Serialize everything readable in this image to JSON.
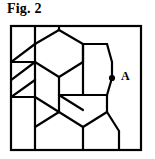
{
  "figure": {
    "caption": "Fig. 2",
    "type": "honeycomb-lattice-diagram",
    "stroke_color": "#000000",
    "frame_color": "#000000",
    "background_color": "#ffffff",
    "line_width": 2.2,
    "frame_line_width": 2.2
  },
  "frame": {
    "x": 11,
    "y": 26,
    "width": 130,
    "height": 124
  },
  "labels": {
    "point_a": "A"
  },
  "markers": {
    "point_a": {
      "label": "A",
      "dot_x": 112,
      "dot_y": 78,
      "dot_radius": 3.1,
      "label_x": 121,
      "label_y": 80
    }
  },
  "lattice": {
    "geometry_note": "Pointy-top hexagons in a honeycomb tiling, clipped by the frame rectangle.",
    "edges": [
      {
        "name": "hex-edge-top-left-stub",
        "x1": 35,
        "y1": 26,
        "x2": 35,
        "y2": 44
      },
      {
        "name": "hex-edge-upper-left-diag-a",
        "x1": 35,
        "y1": 44,
        "x2": 11,
        "y2": 62
      },
      {
        "name": "hex-edge-upper-mid-diag-a",
        "x1": 35,
        "y1": 44,
        "x2": 59,
        "y2": 30
      },
      {
        "name": "hex-edge-top-mid-stub",
        "x1": 59,
        "y1": 30,
        "x2": 59,
        "y2": 26
      },
      {
        "name": "hex-edge-upper-right-diag-a",
        "x1": 59,
        "y1": 30,
        "x2": 83,
        "y2": 44
      },
      {
        "name": "hex-edge-upper-right-vert-a",
        "x1": 83,
        "y1": 44,
        "x2": 83,
        "y2": 62
      },
      {
        "name": "hex-edge-mid-upper-diag-b",
        "x1": 83,
        "y1": 62,
        "x2": 59,
        "y2": 77
      },
      {
        "name": "hex-edge-mid-left-diag-b",
        "x1": 59,
        "y1": 77,
        "x2": 35,
        "y2": 62
      },
      {
        "name": "hex-edge-mid-left-vert-b",
        "x1": 35,
        "y1": 62,
        "x2": 35,
        "y2": 44
      },
      {
        "name": "hex-edge-left-stub-upper",
        "x1": 11,
        "y1": 62,
        "x2": 35,
        "y2": 62
      },
      {
        "name": "hex-edge-left-diag-mid",
        "x1": 35,
        "y1": 62,
        "x2": 11,
        "y2": 80
      },
      {
        "name": "hex-edge-left-lower-vert",
        "x1": 35,
        "y1": 62,
        "x2": 35,
        "y2": 80
      },
      {
        "name": "hex-edge-left-lower-diag",
        "x1": 35,
        "y1": 80,
        "x2": 11,
        "y2": 97
      },
      {
        "name": "hex-edge-left-stub-lower",
        "x1": 11,
        "y1": 97,
        "x2": 35,
        "y2": 97
      },
      {
        "name": "hex-edge-left-mid-vert-c",
        "x1": 35,
        "y1": 80,
        "x2": 35,
        "y2": 97
      },
      {
        "name": "hex-edge-mid-lower-diag-c",
        "x1": 35,
        "y1": 97,
        "x2": 59,
        "y2": 112
      },
      {
        "name": "hex-edge-mid-center-vert-c",
        "x1": 59,
        "y1": 77,
        "x2": 59,
        "y2": 95
      },
      {
        "name": "hex-edge-mid-right-diag-c",
        "x1": 59,
        "y1": 95,
        "x2": 83,
        "y2": 110
      },
      {
        "name": "hex-edge-right-upper-diag-a",
        "x1": 83,
        "y1": 44,
        "x2": 107,
        "y2": 44
      },
      {
        "name": "hex-edge-right-top-a",
        "x1": 107,
        "y1": 44,
        "x2": 112,
        "y2": 62
      },
      {
        "name": "hex-edge-right-vert-a",
        "x1": 112,
        "y1": 62,
        "x2": 112,
        "y2": 78
      },
      {
        "name": "hex-edge-right-lower-diag-a",
        "x1": 112,
        "y1": 78,
        "x2": 107,
        "y2": 95
      },
      {
        "name": "hex-edge-right-bottom-a",
        "x1": 107,
        "y1": 95,
        "x2": 83,
        "y2": 95
      },
      {
        "name": "hex-edge-right-mid-link",
        "x1": 83,
        "y1": 62,
        "x2": 83,
        "y2": 44
      },
      {
        "name": "hex-edge-center-right-vert",
        "x1": 83,
        "y1": 95,
        "x2": 83,
        "y2": 62
      },
      {
        "name": "hex-edge-center-low-left",
        "x1": 83,
        "y1": 95,
        "x2": 59,
        "y2": 95
      },
      {
        "name": "hex-edge-lower-center-vert",
        "x1": 59,
        "y1": 95,
        "x2": 59,
        "y2": 112
      },
      {
        "name": "hex-edge-lower-left-diag",
        "x1": 59,
        "y1": 112,
        "x2": 35,
        "y2": 127
      },
      {
        "name": "hex-edge-lower-left-stub",
        "x1": 35,
        "y1": 127,
        "x2": 35,
        "y2": 150
      },
      {
        "name": "hex-edge-lower-center-diag",
        "x1": 59,
        "y1": 112,
        "x2": 83,
        "y2": 127
      },
      {
        "name": "hex-edge-lower-center-stub",
        "x1": 83,
        "y1": 127,
        "x2": 83,
        "y2": 150
      },
      {
        "name": "hex-edge-lower-right-diag",
        "x1": 83,
        "y1": 127,
        "x2": 107,
        "y2": 112
      },
      {
        "name": "hex-edge-lower-right-vert",
        "x1": 107,
        "y1": 112,
        "x2": 107,
        "y2": 95
      },
      {
        "name": "hex-edge-bottom-right-diag",
        "x1": 107,
        "y1": 112,
        "x2": 119,
        "y2": 131
      },
      {
        "name": "hex-edge-bottom-right-stub",
        "x1": 119,
        "y1": 131,
        "x2": 119,
        "y2": 150
      },
      {
        "name": "hex-edge-mid-low-left-diag",
        "x1": 35,
        "y1": 97,
        "x2": 35,
        "y2": 127
      }
    ]
  }
}
